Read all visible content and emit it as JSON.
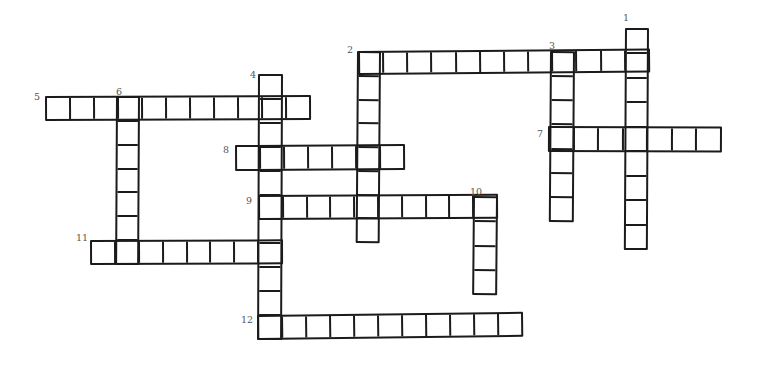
{
  "puzzle": {
    "name": "hand-drawn-crossword-grid",
    "background_color": "#ffffff",
    "line_color": "#1b1b1b",
    "number_color": "#555555",
    "numbers": [
      {
        "n": "1",
        "x": 623,
        "y": 13
      },
      {
        "n": "2",
        "x": 347,
        "y": 45
      },
      {
        "n": "3",
        "x": 549,
        "y": 41
      },
      {
        "n": "4",
        "x": 250,
        "y": 70
      },
      {
        "n": "5",
        "x": 34,
        "y": 92
      },
      {
        "n": "6",
        "x": 116,
        "y": 87
      },
      {
        "n": "7",
        "x": 537,
        "y": 129
      },
      {
        "n": "8",
        "x": 223,
        "y": 145
      },
      {
        "n": "9",
        "x": 246,
        "y": 196
      },
      {
        "n": "10",
        "x": 470,
        "y": 187
      },
      {
        "n": "11",
        "x": 76,
        "y": 233
      },
      {
        "n": "12",
        "x": 241,
        "y": 315
      }
    ],
    "words": [
      {
        "number": "2",
        "direction": "across",
        "x": 358,
        "y": 51,
        "cells": 12,
        "cell_size": 24.33,
        "thickness": 24,
        "tilt_deg": -0.5
      },
      {
        "number": "5",
        "direction": "across",
        "x": 45,
        "y": 96,
        "cells": 11,
        "cell_size": 24.18,
        "thickness": 25,
        "tilt_deg": -0.2
      },
      {
        "number": "7",
        "direction": "across",
        "x": 548,
        "y": 126,
        "cells": 7,
        "cell_size": 24.86,
        "thickness": 26,
        "tilt_deg": 0.2
      },
      {
        "number": "8",
        "direction": "across",
        "x": 235,
        "y": 145,
        "cells": 7,
        "cell_size": 24.29,
        "thickness": 26,
        "tilt_deg": -0.3
      },
      {
        "number": "9",
        "direction": "across",
        "x": 258,
        "y": 195,
        "cells": 10,
        "cell_size": 24.0,
        "thickness": 25,
        "tilt_deg": -0.3
      },
      {
        "number": "11",
        "direction": "across",
        "x": 90,
        "y": 240,
        "cells": 8,
        "cell_size": 24.13,
        "thickness": 25,
        "tilt_deg": -0.2
      },
      {
        "number": "12",
        "direction": "across",
        "x": 257,
        "y": 315,
        "cells": 11,
        "cell_size": 24.18,
        "thickness": 25,
        "tilt_deg": -0.7
      },
      {
        "number": "1",
        "direction": "down",
        "x": 625,
        "y": 28,
        "cells": 9,
        "cell_size": 24.67,
        "thickness": 24,
        "tilt_deg": 0.3
      },
      {
        "number": "2",
        "direction": "down",
        "x": 357,
        "y": 51,
        "cells": 8,
        "cell_size": 24.0,
        "thickness": 24,
        "tilt_deg": 0.4
      },
      {
        "number": "3",
        "direction": "down",
        "x": 550,
        "y": 51,
        "cells": 7,
        "cell_size": 24.43,
        "thickness": 25,
        "tilt_deg": 0.4
      },
      {
        "number": "4",
        "direction": "down",
        "x": 258,
        "y": 74,
        "cells": 11,
        "cell_size": 24.18,
        "thickness": 25,
        "tilt_deg": 0.2
      },
      {
        "number": "6",
        "direction": "down",
        "x": 116,
        "y": 96,
        "cells": 7,
        "cell_size": 24.14,
        "thickness": 24,
        "tilt_deg": 0.3
      },
      {
        "number": "10",
        "direction": "down",
        "x": 473,
        "y": 196,
        "cells": 4,
        "cell_size": 24.75,
        "thickness": 25,
        "tilt_deg": 0.5
      }
    ]
  }
}
